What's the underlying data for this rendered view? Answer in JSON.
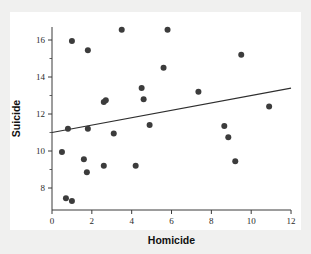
{
  "chart_data": {
    "type": "scatter",
    "title": "",
    "xlabel": "Homicide",
    "ylabel": "Suicide",
    "xlim": [
      0,
      12
    ],
    "ylim": [
      7,
      17
    ],
    "grid": false,
    "legend": null,
    "xticks": [
      0,
      2,
      4,
      6,
      8,
      10,
      12
    ],
    "xtick_labels": [
      "0",
      "2",
      "4",
      "6",
      "8",
      "10",
      "12"
    ],
    "yticks": [
      8,
      10,
      12,
      14,
      16
    ],
    "ytick_labels": [
      "8",
      "10",
      "12",
      "14",
      "16"
    ],
    "y_minor_ticks": [
      9,
      11,
      13,
      15,
      17
    ],
    "marker": "filled-circle",
    "marker_color": "#3c3c3c",
    "marker_size": 3,
    "points": [
      {
        "x": 0.5,
        "y": 9.95
      },
      {
        "x": 0.7,
        "y": 7.45
      },
      {
        "x": 1.0,
        "y": 7.3
      },
      {
        "x": 0.8,
        "y": 11.2
      },
      {
        "x": 1.0,
        "y": 15.95
      },
      {
        "x": 1.8,
        "y": 15.45
      },
      {
        "x": 1.6,
        "y": 9.55
      },
      {
        "x": 1.75,
        "y": 8.85
      },
      {
        "x": 1.8,
        "y": 11.2
      },
      {
        "x": 2.6,
        "y": 12.65
      },
      {
        "x": 2.7,
        "y": 12.75
      },
      {
        "x": 2.6,
        "y": 9.2
      },
      {
        "x": 3.1,
        "y": 10.95
      },
      {
        "x": 3.5,
        "y": 16.55
      },
      {
        "x": 4.2,
        "y": 9.2
      },
      {
        "x": 4.5,
        "y": 13.4
      },
      {
        "x": 4.6,
        "y": 12.8
      },
      {
        "x": 4.9,
        "y": 11.4
      },
      {
        "x": 5.6,
        "y": 14.5
      },
      {
        "x": 5.8,
        "y": 16.55
      },
      {
        "x": 7.35,
        "y": 13.2
      },
      {
        "x": 8.65,
        "y": 11.35
      },
      {
        "x": 8.85,
        "y": 10.75
      },
      {
        "x": 9.2,
        "y": 9.45
      },
      {
        "x": 9.5,
        "y": 15.2
      },
      {
        "x": 10.9,
        "y": 12.4
      }
    ],
    "fit_line": {
      "type": "linear-regression",
      "x_start": 0,
      "y_start": 11.0,
      "x_end": 12.0,
      "y_end": 13.4,
      "color": "#2e2e2e"
    }
  },
  "figure": {
    "background_color": "#f0f0ef",
    "plot_background_color": "#ffffff",
    "axis_color": "#3a3a3a"
  }
}
